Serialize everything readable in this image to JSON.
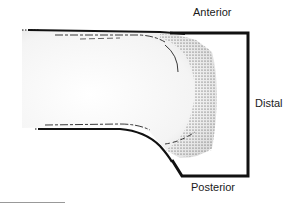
{
  "diagram": {
    "labels": {
      "anterior": "Anterior",
      "distal": "Distal",
      "posterior": "Posterior"
    },
    "colors": {
      "outline": "#111111",
      "stipple": "#222222",
      "shading": "#e6e6e6",
      "background": "#ffffff"
    }
  }
}
